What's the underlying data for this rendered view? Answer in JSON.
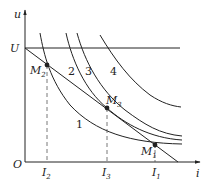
{
  "diagram": {
    "axes": {
      "y_label": "u",
      "x_label": "i",
      "origin_label": "O"
    },
    "voltage_label": "U",
    "curve_labels": [
      "1",
      "2",
      "3",
      "4"
    ],
    "points": [
      {
        "name": "M",
        "sub": "1"
      },
      {
        "name": "M",
        "sub": "2"
      },
      {
        "name": "M",
        "sub": "3"
      }
    ],
    "currents": [
      {
        "name": "I",
        "sub": "1"
      },
      {
        "name": "I",
        "sub": "2"
      },
      {
        "name": "I",
        "sub": "3"
      }
    ],
    "colors": {
      "line": "#222222",
      "dashed": "#555555"
    }
  }
}
